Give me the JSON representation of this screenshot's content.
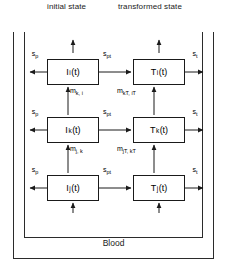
{
  "header": {
    "initial_state": "initial state",
    "transformed_state": "transformed state"
  },
  "container": {
    "blood_label": "Blood"
  },
  "rows": [
    {
      "index": "i",
      "initial_box": {
        "symbol": "I",
        "subscript": "i",
        "arg": "(t)"
      },
      "transformed_box": {
        "symbol": "T",
        "subscript": "i",
        "arg": "(t)"
      },
      "left_flow": {
        "symbol": "s",
        "subscript": "p"
      },
      "middle_flow": {
        "symbol": "s",
        "subscript": "pt"
      },
      "right_flow": {
        "symbol": "s",
        "subscript": "t"
      }
    },
    {
      "index": "k",
      "initial_box": {
        "symbol": "I",
        "subscript": "k",
        "arg": "(t)"
      },
      "transformed_box": {
        "symbol": "T",
        "subscript": "k",
        "arg": "(t)"
      },
      "left_flow": {
        "symbol": "s",
        "subscript": "p"
      },
      "middle_flow": {
        "symbol": "s",
        "subscript": "pt"
      },
      "right_flow": {
        "symbol": "s",
        "subscript": "t"
      }
    },
    {
      "index": "j",
      "initial_box": {
        "symbol": "I",
        "subscript": "j",
        "arg": "(t)"
      },
      "transformed_box": {
        "symbol": "T",
        "subscript": "j",
        "arg": "(t)"
      },
      "left_flow": {
        "symbol": "s",
        "subscript": "p"
      },
      "middle_flow": {
        "symbol": "s",
        "subscript": "pt"
      },
      "right_flow": {
        "symbol": "s",
        "subscript": "t"
      }
    }
  ],
  "transfer_flows": [
    {
      "symbol": "m",
      "subscript": "k, i",
      "from_row": "k",
      "to_row": "i",
      "column": "initial"
    },
    {
      "symbol": "m",
      "subscript": "kT, iT",
      "from_row": "k",
      "to_row": "i",
      "column": "transformed"
    },
    {
      "symbol": "m",
      "subscript": "j, k",
      "from_row": "j",
      "to_row": "k",
      "column": "initial"
    },
    {
      "symbol": "m",
      "subscript": "jT, kT",
      "from_row": "j",
      "to_row": "k",
      "column": "transformed"
    }
  ],
  "colors": {
    "stroke": "#1a1a1a",
    "frame": "#2b2b2b",
    "background": "#ffffff"
  }
}
